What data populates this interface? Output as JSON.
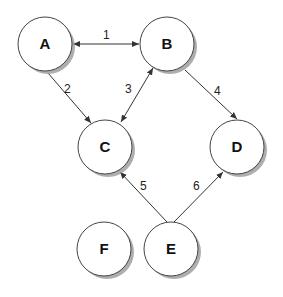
{
  "diagram": {
    "type": "directed-graph",
    "nodes": [
      {
        "id": "A",
        "label": "A",
        "cx": 45,
        "cy": 44,
        "r": 27
      },
      {
        "id": "B",
        "label": "B",
        "cx": 167,
        "cy": 44,
        "r": 27
      },
      {
        "id": "C",
        "label": "C",
        "cx": 105,
        "cy": 147,
        "r": 27
      },
      {
        "id": "D",
        "label": "D",
        "cx": 237,
        "cy": 147,
        "r": 27
      },
      {
        "id": "F",
        "label": "F",
        "cx": 104,
        "cy": 249,
        "r": 27
      },
      {
        "id": "E",
        "label": "E",
        "cx": 171,
        "cy": 249,
        "r": 27
      }
    ],
    "edges": [
      {
        "id": "1",
        "label": "1",
        "from": "A",
        "to": "B",
        "bidirectional": true
      },
      {
        "id": "2",
        "label": "2",
        "from": "A",
        "to": "C",
        "bidirectional": false
      },
      {
        "id": "3",
        "label": "3",
        "from": "C",
        "to": "B",
        "bidirectional": true
      },
      {
        "id": "4",
        "label": "4",
        "from": "B",
        "to": "D",
        "bidirectional": false
      },
      {
        "id": "5",
        "label": "5",
        "from": "E",
        "to": "C",
        "bidirectional": false
      },
      {
        "id": "6",
        "label": "6",
        "from": "E",
        "to": "D",
        "bidirectional": false
      }
    ]
  },
  "colors": {
    "node_fill": "#ffffff",
    "node_stroke": "#444444",
    "shadow": "#9a9a9a",
    "edge": "#333333"
  }
}
